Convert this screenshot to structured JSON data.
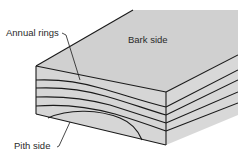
{
  "diagram": {
    "labels": {
      "annual_rings": "Annual rings",
      "bark_side": "Bark side",
      "pith_side": "Pith side"
    },
    "colors": {
      "face_fill": "#d4d4d4",
      "top_fill": "#d0d0d0",
      "line": "#1a1a1a",
      "background": "#ffffff"
    }
  }
}
